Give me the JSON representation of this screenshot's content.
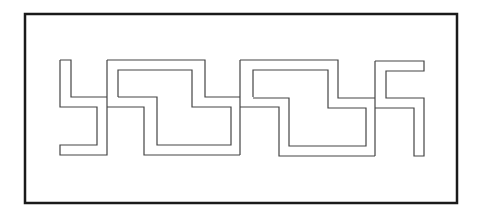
{
  "diagram": {
    "title": "",
    "colors": {
      "background": "#ffffff",
      "stroke": "#333333",
      "frame": "#1a1a1a"
    }
  }
}
